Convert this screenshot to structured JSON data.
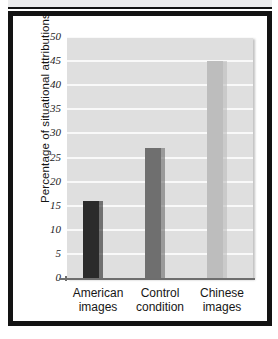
{
  "figure": {
    "background_color": "#ffffff",
    "frame_color": "#131313",
    "plot_background_color": "#dfdfdf",
    "gridline_color": "#f9f9f9"
  },
  "chart_data": {
    "type": "bar",
    "title": "",
    "subtitle": "",
    "xlabel": "",
    "ylabel": "Percentage of situational attributions",
    "categories": [
      "American images",
      "Control condition",
      "Chinese images"
    ],
    "category_lines": [
      [
        "American",
        "images"
      ],
      [
        "Control",
        "condition"
      ],
      [
        "Chinese",
        "images"
      ]
    ],
    "values": [
      16,
      27,
      45
    ],
    "bar_colors": [
      "#2b2b2b",
      "#6f6f6f",
      "#bdbdbd"
    ],
    "ylim": [
      0,
      50
    ],
    "yticks": [
      0,
      5,
      10,
      15,
      20,
      25,
      30,
      35,
      40,
      45,
      50
    ],
    "ytick_labels": [
      "0",
      "5",
      "10",
      "15",
      "20",
      "25",
      "30",
      "35",
      "40",
      "45",
      "50"
    ],
    "grid": true,
    "grid_axis": "y",
    "legend": false,
    "legend_position": "none",
    "annotations": []
  }
}
